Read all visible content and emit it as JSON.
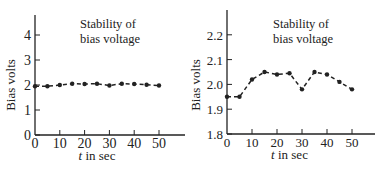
{
  "chart_data": [
    {
      "type": "line",
      "title": "Stability of bias voltage",
      "title_lines": [
        "Stability of",
        "bias voltage"
      ],
      "xlabel": "t in sec",
      "ylabel": "Bias volts",
      "x": [
        0,
        5,
        10,
        15,
        20,
        25,
        30,
        35,
        40,
        45,
        50
      ],
      "series": [
        {
          "name": "Bias voltage",
          "values": [
            1.95,
            1.95,
            2.0,
            2.05,
            2.04,
            2.05,
            1.98,
            2.05,
            2.04,
            2.01,
            1.98
          ]
        }
      ],
      "xticks": [
        0,
        10,
        20,
        30,
        40,
        50
      ],
      "yticks": [
        0,
        1,
        2,
        3,
        4
      ],
      "xlim": [
        0,
        60
      ],
      "ylim": [
        0,
        5
      ],
      "grid": false,
      "line_style": "dashed"
    },
    {
      "type": "line",
      "title": "Stability of bias voltage",
      "title_lines": [
        "Stability of",
        "bias voltage"
      ],
      "xlabel": "t in sec",
      "ylabel": "Bias volts",
      "x": [
        0,
        5,
        10,
        15,
        20,
        25,
        30,
        35,
        40,
        45,
        50
      ],
      "series": [
        {
          "name": "Bias voltage",
          "values": [
            1.95,
            1.95,
            2.02,
            2.05,
            2.04,
            2.045,
            1.98,
            2.05,
            2.04,
            2.01,
            1.98
          ]
        }
      ],
      "xticks": [
        0,
        10,
        20,
        30,
        40,
        50
      ],
      "yticks": [
        1.8,
        1.9,
        2.0,
        2.1,
        2.2
      ],
      "ytick_labels": [
        "1.8",
        "1.9",
        "2.0",
        "2.1",
        "2.2"
      ],
      "xlim": [
        0,
        60
      ],
      "ylim": [
        1.8,
        2.3
      ],
      "grid": false,
      "line_style": "dashed"
    }
  ]
}
